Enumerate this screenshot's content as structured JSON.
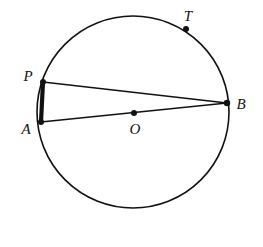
{
  "figure": {
    "background_color": "#ffffff",
    "stroke_color": "#111111",
    "width": 263,
    "height": 247
  },
  "circle": {
    "name": "circle-O",
    "center_x": 133,
    "center_y": 112,
    "radius": 96,
    "stroke_width": 1.6,
    "stroke_color": "#111111",
    "fill": "none"
  },
  "points": [
    {
      "id": "P",
      "label": "P",
      "x": 43,
      "y": 82,
      "label_x": 28,
      "label_y": 76,
      "dot_radius": 3.0,
      "on_circle": true
    },
    {
      "id": "A",
      "label": "A",
      "x": 41,
      "y": 122,
      "label_x": 26,
      "label_y": 129,
      "dot_radius": 3.0,
      "on_circle": true
    },
    {
      "id": "B",
      "label": "B",
      "x": 227,
      "y": 103,
      "label_x": 241,
      "label_y": 104,
      "dot_radius": 3.2,
      "on_circle": true
    },
    {
      "id": "O",
      "label": "O",
      "x": 134,
      "y": 113,
      "label_x": 135,
      "label_y": 129,
      "dot_radius": 3.0,
      "on_circle": false
    },
    {
      "id": "T",
      "label": "T",
      "x": 186,
      "y": 29,
      "label_x": 188,
      "label_y": 16,
      "dot_radius": 3.0,
      "on_circle": true
    }
  ],
  "segments": [
    {
      "id": "PA",
      "from": "P",
      "to": "A",
      "x1": 43,
      "y1": 82,
      "x2": 41,
      "y2": 122,
      "stroke_width": 4.2,
      "emphasis": "bold"
    },
    {
      "id": "PB",
      "from": "P",
      "to": "B",
      "x1": 43,
      "y1": 82,
      "x2": 227,
      "y2": 103,
      "stroke_width": 1.7,
      "emphasis": "normal"
    },
    {
      "id": "AB",
      "from": "A",
      "to": "B",
      "x1": 41,
      "y1": 122,
      "x2": 227,
      "y2": 103,
      "stroke_width": 1.7,
      "emphasis": "normal"
    }
  ]
}
